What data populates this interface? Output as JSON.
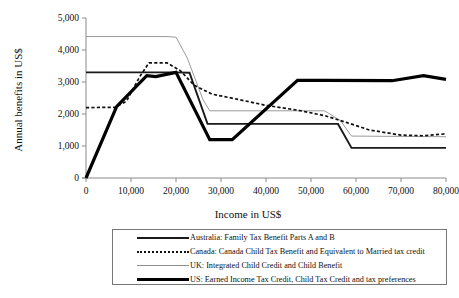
{
  "chart_data": {
    "type": "line",
    "title": "",
    "xlabel": "Income in US$",
    "ylabel": "Annual benefits in US$",
    "xlim": [
      0,
      80000
    ],
    "ylim": [
      0,
      5000
    ],
    "xticks": [
      0,
      10000,
      20000,
      30000,
      40000,
      50000,
      60000,
      70000,
      80000
    ],
    "xticklabels": [
      "0",
      "10,000",
      "20,000",
      "30,000",
      "40,000",
      "50,000",
      "60,000",
      "70,000",
      "80,000"
    ],
    "yticks": [
      0,
      1000,
      2000,
      3000,
      4000,
      5000
    ],
    "yticklabels": [
      "0",
      "1,000",
      "2,000",
      "3,000",
      "4,000",
      "5,000"
    ],
    "grid": false,
    "legend_position": "below",
    "series": [
      {
        "name": "Australia: Family Tax Benefit Parts A and B",
        "key": "australia",
        "style": "solid-medium",
        "color": "#1a1a1a",
        "points": [
          [
            0,
            3300
          ],
          [
            20000,
            3300
          ],
          [
            23000,
            3290
          ],
          [
            27000,
            1690
          ],
          [
            47000,
            1690
          ],
          [
            56000,
            1690
          ],
          [
            59000,
            940
          ],
          [
            80000,
            940
          ]
        ]
      },
      {
        "name": "Canada: Canada Child Tax Benefit and Equivalent to Married tax credit",
        "key": "canada",
        "style": "dotted",
        "color": "#111111",
        "points": [
          [
            0,
            2200
          ],
          [
            6500,
            2210
          ],
          [
            9000,
            2400
          ],
          [
            12000,
            3180
          ],
          [
            14000,
            3600
          ],
          [
            18000,
            3600
          ],
          [
            21000,
            3350
          ],
          [
            24000,
            2900
          ],
          [
            28000,
            2620
          ],
          [
            33000,
            2480
          ],
          [
            40000,
            2270
          ],
          [
            47000,
            2120
          ],
          [
            53000,
            1950
          ],
          [
            58000,
            1730
          ],
          [
            63000,
            1500
          ],
          [
            70000,
            1340
          ],
          [
            75000,
            1320
          ],
          [
            80000,
            1380
          ]
        ]
      },
      {
        "name": "UK: Integrated Child Credit and Child Benefit",
        "key": "uk",
        "style": "solid-thin",
        "color": "#8e8e8e",
        "points": [
          [
            0,
            4420
          ],
          [
            18000,
            4420
          ],
          [
            20000,
            4400
          ],
          [
            22500,
            3750
          ],
          [
            26000,
            2450
          ],
          [
            27500,
            2100
          ],
          [
            47000,
            2100
          ],
          [
            53000,
            2100
          ],
          [
            56500,
            1800
          ],
          [
            59000,
            1310
          ],
          [
            70000,
            1300
          ],
          [
            80000,
            1290
          ]
        ]
      },
      {
        "name": "US: Earned Income Tax Credit, Child Tax Credit and tax preferences",
        "key": "us",
        "style": "solid-thick",
        "color": "#000000",
        "points": [
          [
            0,
            0
          ],
          [
            6800,
            2230
          ],
          [
            13500,
            3200
          ],
          [
            15500,
            3170
          ],
          [
            20000,
            3300
          ],
          [
            27500,
            1200
          ],
          [
            32500,
            1200
          ],
          [
            47000,
            3050
          ],
          [
            53000,
            3050
          ],
          [
            68000,
            3040
          ],
          [
            75000,
            3200
          ],
          [
            80000,
            3080
          ]
        ]
      }
    ]
  },
  "legend": {
    "items": [
      {
        "label": "Australia: Family Tax Benefit Parts A and B",
        "key": "australia"
      },
      {
        "label": "Canada: Canada Child Tax Benefit and Equivalent to Married tax credit",
        "key": "canada"
      },
      {
        "label": "UK: Integrated Child Credit and Child Benefit",
        "key": "uk"
      },
      {
        "label": "US: Earned Income Tax Credit, Child Tax Credit and tax preferences",
        "key": "us"
      }
    ]
  }
}
